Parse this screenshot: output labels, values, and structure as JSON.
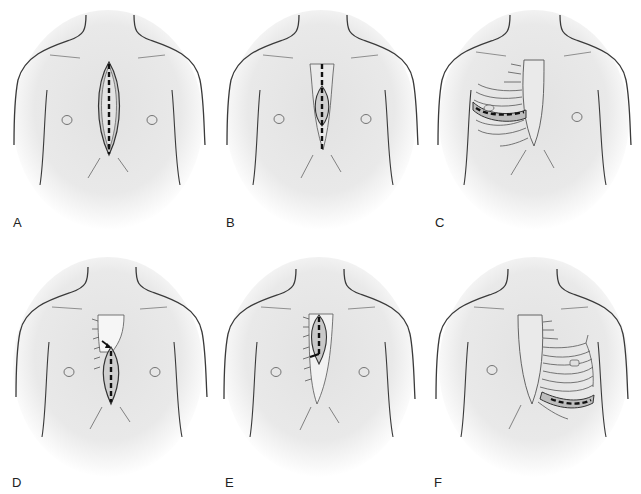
{
  "figure": {
    "panels": [
      {
        "id": "A",
        "label": "A",
        "description": "Full median sternotomy: long vertical incision along the sternum with dashed midline cut line"
      },
      {
        "id": "B",
        "label": "B",
        "description": "Limited skin incision with full-length dashed sternal cut line"
      },
      {
        "id": "C",
        "label": "C",
        "description": "Right anterolateral thoracotomy with ribs shown and dashed intercostal incision"
      },
      {
        "id": "D",
        "label": "D",
        "description": "Partial lower sternotomy with J-shaped extension into right intercostal space (arrow)"
      },
      {
        "id": "E",
        "label": "E",
        "description": "Partial upper sternotomy with J-shaped extension to the right"
      },
      {
        "id": "F",
        "label": "F",
        "description": "Left anterolateral thoracotomy with ribs shown and dashed intercostal incision"
      }
    ]
  },
  "colors": {
    "skin_shade": "#e6e6e6",
    "outline": "#3a3a3a",
    "incision_dash": "#111111",
    "background": "#ffffff"
  }
}
